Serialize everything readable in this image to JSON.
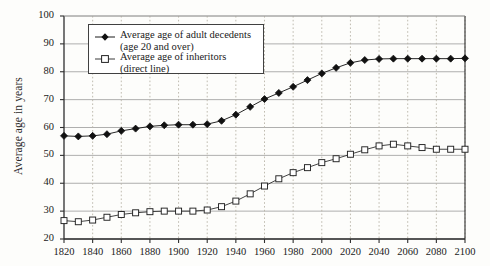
{
  "chart_data": {
    "type": "line",
    "title": "",
    "xlabel": "",
    "ylabel": "Average age in years",
    "xlim": [
      1820,
      2100
    ],
    "ylim": [
      20,
      100
    ],
    "ytick_step": 10,
    "xtick_step": 20,
    "grid": true,
    "legend_position": "upper-left-inside",
    "xticks": [
      "1820",
      "1840",
      "1860",
      "1880",
      "1900",
      "1920",
      "1940",
      "1960",
      "1980",
      "2000",
      "2020",
      "2040",
      "2060",
      "2080",
      "2100"
    ],
    "yticks": [
      "20",
      "30",
      "40",
      "50",
      "60",
      "70",
      "80",
      "90",
      "100"
    ],
    "x": [
      1820,
      1830,
      1840,
      1850,
      1860,
      1870,
      1880,
      1890,
      1900,
      1910,
      1920,
      1930,
      1940,
      1950,
      1960,
      1970,
      1980,
      1990,
      2000,
      2010,
      2020,
      2030,
      2040,
      2050,
      2060,
      2070,
      2080,
      2090,
      2100
    ],
    "series": [
      {
        "name": "Average age of adult decedents",
        "sublabel": "(age 20 and over)",
        "marker": "filled-diamond",
        "color": "#1a1a1a",
        "values": [
          57.0,
          56.8,
          57.0,
          57.6,
          58.8,
          59.6,
          60.4,
          60.8,
          61.0,
          61.0,
          61.2,
          62.4,
          64.6,
          67.4,
          70.2,
          72.4,
          74.6,
          77.0,
          79.4,
          81.4,
          83.2,
          84.2,
          84.6,
          84.7,
          84.7,
          84.7,
          84.7,
          84.7,
          84.8
        ]
      },
      {
        "name": "Average age of inheritors",
        "sublabel": "(direct line)",
        "marker": "open-square",
        "color": "#3a3a3a",
        "values": [
          26.6,
          26.2,
          26.8,
          27.8,
          28.8,
          29.4,
          29.8,
          30.0,
          30.0,
          30.0,
          30.4,
          31.6,
          33.6,
          36.2,
          39.0,
          41.6,
          43.8,
          45.6,
          47.4,
          48.8,
          50.4,
          52.0,
          53.4,
          54.0,
          53.4,
          52.8,
          52.2,
          52.2,
          52.2
        ]
      }
    ]
  },
  "legend": {
    "entries": [
      {
        "label": "Average age of adult decedents",
        "sublabel": "(age 20 and over)"
      },
      {
        "label": "Average age of inheritors",
        "sublabel": "(direct line)"
      }
    ]
  },
  "axes": {
    "y_title": "Average age in years"
  }
}
